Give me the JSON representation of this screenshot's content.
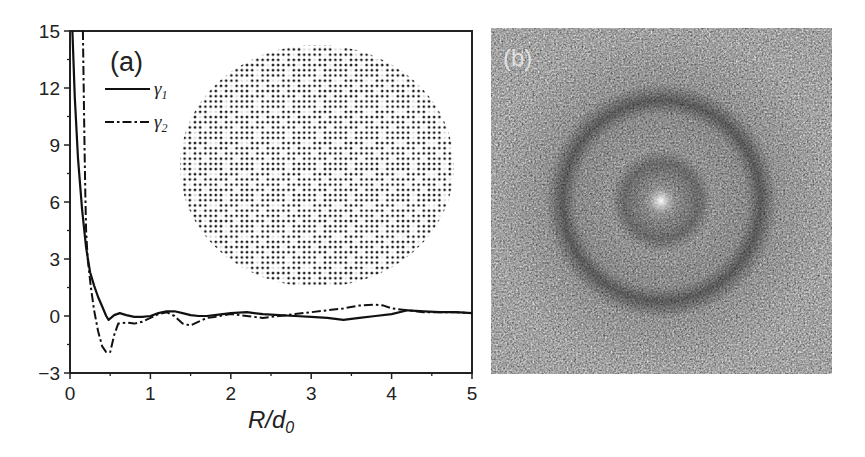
{
  "chart_data": [
    {
      "panel": "(a)",
      "type": "line",
      "title": "",
      "xlabel": "R/d0",
      "xlabel_main": "R/d",
      "xlabel_sub": "0",
      "ylabel": "",
      "xlim": [
        0,
        5
      ],
      "ylim": [
        -3,
        15
      ],
      "xticks": [
        "0",
        "1",
        "2",
        "3",
        "4",
        "5"
      ],
      "yticks": [
        "15",
        "12",
        "9",
        "6",
        "3",
        "0",
        "−3"
      ],
      "grid": false,
      "legend_position": "upper-left",
      "series": [
        {
          "name": "γ1",
          "label_main": "γ",
          "label_sub": "1",
          "style": "solid",
          "x": [
            0.03,
            0.06,
            0.1,
            0.15,
            0.2,
            0.25,
            0.3,
            0.35,
            0.4,
            0.45,
            0.48,
            0.55,
            0.62,
            0.7,
            0.8,
            0.9,
            1.0,
            1.1,
            1.2,
            1.3,
            1.4,
            1.5,
            1.6,
            1.7,
            1.8,
            1.9,
            2.0,
            2.2,
            2.4,
            2.6,
            2.8,
            3.0,
            3.2,
            3.4,
            3.6,
            3.8,
            4.0,
            4.2,
            4.4,
            4.6,
            4.8,
            5.0
          ],
          "y": [
            15,
            11.5,
            8.3,
            5.6,
            3.6,
            2.3,
            1.6,
            1.0,
            0.5,
            0.0,
            -0.2,
            0.05,
            0.15,
            0.05,
            -0.05,
            -0.05,
            0.0,
            0.15,
            0.25,
            0.25,
            0.15,
            0.05,
            0.0,
            0.0,
            0.05,
            0.1,
            0.15,
            0.2,
            0.1,
            0.05,
            0.0,
            -0.05,
            -0.1,
            -0.2,
            -0.1,
            0.0,
            0.1,
            0.3,
            0.25,
            0.2,
            0.2,
            0.15
          ]
        },
        {
          "name": "γ2",
          "label_main": "γ",
          "label_sub": "2",
          "style": "dash-dot",
          "x": [
            0.16,
            0.17,
            0.18,
            0.19,
            0.2,
            0.22,
            0.26,
            0.3,
            0.35,
            0.4,
            0.45,
            0.5,
            0.55,
            0.6,
            0.7,
            0.8,
            0.9,
            1.0,
            1.1,
            1.2,
            1.3,
            1.4,
            1.5,
            1.6,
            1.7,
            1.8,
            2.0,
            2.2,
            2.4,
            2.6,
            2.8,
            3.0,
            3.2,
            3.4,
            3.6,
            3.8,
            3.9,
            4.0,
            4.2,
            4.4,
            4.6,
            4.8,
            5.0
          ],
          "y": [
            15,
            12,
            9,
            6.5,
            4.5,
            3.0,
            1.5,
            0.3,
            -0.8,
            -1.6,
            -1.9,
            -1.9,
            -1.0,
            -0.4,
            -0.35,
            -0.4,
            -0.3,
            -0.1,
            0.1,
            0.2,
            0.0,
            -0.4,
            -0.5,
            -0.3,
            -0.1,
            -0.05,
            0.1,
            0.0,
            -0.1,
            0.0,
            0.1,
            0.2,
            0.3,
            0.4,
            0.55,
            0.6,
            0.55,
            0.4,
            0.3,
            0.2,
            0.2,
            0.2,
            0.15
          ]
        }
      ],
      "inset": {
        "type": "point-lattice",
        "description": "circular patch of a dot lattice (quasicrystal-like packing), black dots on white"
      }
    },
    {
      "panel": "(b)",
      "type": "heatmap",
      "title": "",
      "description": "grayscale speckle image with a bright central spot and a dark annular ring structure"
    }
  ],
  "panel_labels": {
    "a": "(a)",
    "b": "(b)"
  },
  "colors": {
    "line": "#111111",
    "axis": "#222222",
    "panel_b_background": "#4a4a4a"
  }
}
